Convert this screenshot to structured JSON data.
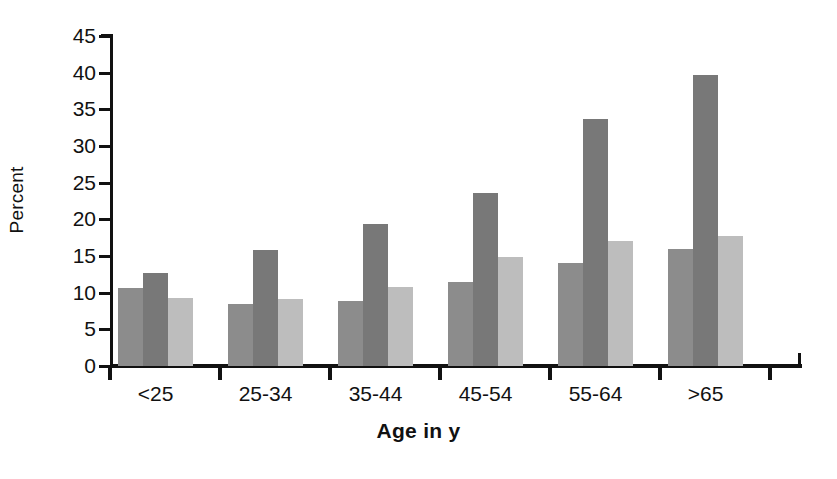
{
  "chart_data": {
    "type": "bar",
    "title": "",
    "xlabel": "Age in y",
    "ylabel": "Percent",
    "categories": [
      "<25",
      "25-34",
      "35-44",
      "45-54",
      "55-64",
      ">65"
    ],
    "series": [
      {
        "name": "series-1",
        "color": "#8c8c8c",
        "values": [
          10.6,
          8.4,
          8.9,
          11.5,
          14.0,
          16.0
        ]
      },
      {
        "name": "series-2",
        "color": "#787878",
        "values": [
          12.7,
          15.8,
          19.3,
          23.6,
          33.7,
          39.7
        ]
      },
      {
        "name": "series-3",
        "color": "#bdbdbd",
        "values": [
          9.3,
          9.2,
          10.8,
          14.8,
          17.1,
          17.7
        ]
      }
    ],
    "ylim": [
      0,
      45
    ],
    "ytick_labels": [
      "45",
      "40",
      "35",
      "30",
      "25",
      "20",
      "15",
      "10",
      "5",
      "0"
    ],
    "ytick_values": [
      45,
      40,
      35,
      30,
      25,
      20,
      15,
      10,
      5,
      0
    ],
    "ytick_step": 5,
    "grid": false,
    "legend": "none",
    "axis_color": "#111111",
    "background": "#ffffff"
  },
  "axes": {
    "y_title": "Percent",
    "x_title": "Age in y"
  }
}
